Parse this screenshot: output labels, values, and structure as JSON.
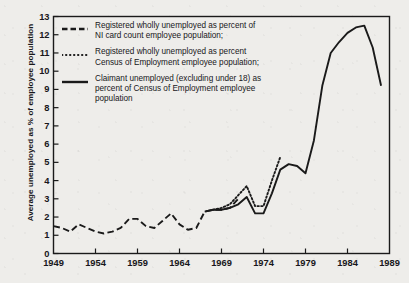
{
  "chart_data": {
    "type": "line",
    "title": "",
    "subtitle": "",
    "xlabel": "",
    "ylabel": "Average unemployed as % of employee population",
    "xlim": [
      1949,
      1989
    ],
    "ylim": [
      0,
      13
    ],
    "ytick_labels": [
      "0",
      "1",
      "2",
      "3",
      "4",
      "5",
      "6",
      "7",
      "8",
      "9",
      "10",
      "11",
      "12",
      "13"
    ],
    "ytick_values": [
      0,
      1,
      2,
      3,
      4,
      5,
      6,
      7,
      8,
      9,
      10,
      11,
      12,
      13
    ],
    "xtick_labels": [
      "1949",
      "1954",
      "1959",
      "1964",
      "1969",
      "1974",
      "1979",
      "1984",
      "1989"
    ],
    "xtick_values": [
      1949,
      1954,
      1959,
      1964,
      1969,
      1974,
      1979,
      1984,
      1989
    ],
    "grid": false,
    "legend_position": "upper left",
    "series": [
      {
        "name": "Registered wholly unemployed as percent of NI card count employee population;",
        "style": "dashed",
        "color": "#1a1a1a",
        "x": [
          1949,
          1950,
          1951,
          1952,
          1953,
          1954,
          1955,
          1956,
          1957,
          1958,
          1959,
          1960,
          1961,
          1962,
          1963,
          1964,
          1965,
          1966,
          1967,
          1968,
          1969,
          1970,
          1971
        ],
        "values": [
          1.5,
          1.4,
          1.2,
          1.6,
          1.4,
          1.2,
          1.1,
          1.2,
          1.4,
          1.9,
          1.9,
          1.5,
          1.4,
          1.8,
          2.2,
          1.6,
          1.3,
          1.4,
          2.3,
          2.4,
          2.4,
          2.5,
          3.0
        ]
      },
      {
        "name": "Registered wholly unemployed as percent Census of Employment employee population;",
        "style": "dotted",
        "color": "#1a1a1a",
        "x": [
          1968,
          1969,
          1970,
          1971,
          1972,
          1973,
          1974,
          1975,
          1976
        ],
        "values": [
          2.4,
          2.5,
          2.7,
          3.2,
          3.7,
          2.6,
          2.6,
          4.0,
          5.3
        ]
      },
      {
        "name": "Claimant unemployed (excluding under 18) as percent of Census of Employment employee population",
        "style": "solid",
        "color": "#1a1a1a",
        "x": [
          1967,
          1968,
          1969,
          1970,
          1971,
          1972,
          1973,
          1974,
          1975,
          1976,
          1977,
          1978,
          1979,
          1980,
          1981,
          1982,
          1983,
          1984,
          1985,
          1986,
          1987,
          1988
        ],
        "values": [
          2.3,
          2.4,
          2.4,
          2.5,
          2.7,
          3.1,
          2.2,
          2.2,
          3.3,
          4.6,
          4.9,
          4.8,
          4.4,
          6.2,
          9.2,
          11.0,
          11.6,
          12.1,
          12.4,
          12.5,
          11.3,
          9.2
        ]
      }
    ],
    "legend": [
      {
        "style": "dashed",
        "lines": [
          "Registered wholly unemployed as percent of",
          "NI card count employee population;"
        ]
      },
      {
        "style": "dotted",
        "lines": [
          "Registered wholly unemployed as percent",
          "Census of Employment employee population;"
        ]
      },
      {
        "style": "solid",
        "lines": [
          "Claimant unemployed (excluding under 18) as",
          "percent of Census of Employment employee",
          "population"
        ]
      }
    ],
    "colors": {
      "line": "#1a1a1a",
      "axis": "#1a1a1a",
      "background": "#eeedea",
      "text": "#18171a"
    }
  }
}
